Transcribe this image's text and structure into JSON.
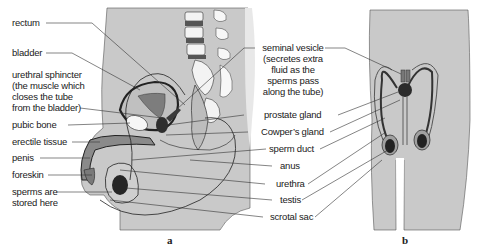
{
  "figure": {
    "panel_a_caption": "a",
    "panel_b_caption": "b",
    "colors": {
      "body_fill": "#c9c9c9",
      "organ_dark": "#3a3a3a",
      "organ_mid": "#8a8a8a",
      "outline": "#2b2b2b",
      "bone_fill": "#f2f2f2",
      "background": "#ffffff"
    }
  },
  "labels_left": [
    {
      "id": "rectum",
      "text": "rectum"
    },
    {
      "id": "bladder",
      "text": "bladder"
    },
    {
      "id": "urethral_sphincter_1",
      "text": "urethral sphincter"
    },
    {
      "id": "urethral_sphincter_2",
      "text": "(the muscle which"
    },
    {
      "id": "urethral_sphincter_3",
      "text": "closes the tube"
    },
    {
      "id": "urethral_sphincter_4",
      "text": "from the bladder)"
    },
    {
      "id": "pubic_bone",
      "text": "pubic bone"
    },
    {
      "id": "erectile_tissue",
      "text": "erectile tissue"
    },
    {
      "id": "penis",
      "text": "penis"
    },
    {
      "id": "foreskin",
      "text": "foreskin"
    },
    {
      "id": "sperms_stored_1",
      "text": "sperms are"
    },
    {
      "id": "sperms_stored_2",
      "text": "stored here"
    }
  ],
  "labels_right": [
    {
      "id": "seminal_vesicle_1",
      "text": "seminal vesicle"
    },
    {
      "id": "seminal_vesicle_2",
      "text": "(secretes extra"
    },
    {
      "id": "seminal_vesicle_3",
      "text": "fluid as the"
    },
    {
      "id": "seminal_vesicle_4",
      "text": "sperms pass"
    },
    {
      "id": "seminal_vesicle_5",
      "text": "along the tube)"
    },
    {
      "id": "prostate_gland",
      "text": "prostate gland"
    },
    {
      "id": "cowpers_gland",
      "text": "Cowper’s gland"
    },
    {
      "id": "sperm_duct",
      "text": "sperm duct"
    },
    {
      "id": "anus",
      "text": "anus"
    },
    {
      "id": "urethra",
      "text": "urethra"
    },
    {
      "id": "testis",
      "text": "testis"
    },
    {
      "id": "scrotal_sac",
      "text": "scrotal sac"
    }
  ]
}
